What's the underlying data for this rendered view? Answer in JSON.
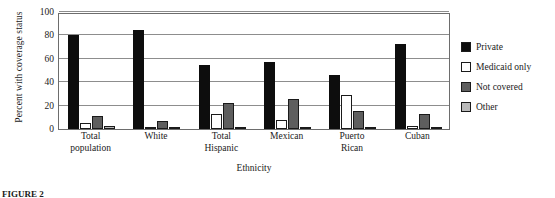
{
  "chart_data": {
    "type": "bar",
    "title": "",
    "xlabel": "Ethnicity",
    "ylabel": "Percent with coverage status",
    "ylim": [
      0,
      100
    ],
    "yticks": [
      0,
      20,
      40,
      60,
      80,
      100
    ],
    "grid": true,
    "legend_position": "right",
    "categories": [
      "Total population",
      "White",
      "Total Hispanic",
      "Mexican",
      "Puerto Rican",
      "Cuban"
    ],
    "category_lines": [
      [
        "Total",
        "population"
      ],
      [
        "White",
        ""
      ],
      [
        "Total",
        "Hispanic"
      ],
      [
        "Mexican",
        ""
      ],
      [
        "Puerto",
        "Rican"
      ],
      [
        "Cuban",
        ""
      ]
    ],
    "series": [
      {
        "name": "Private",
        "key": "private",
        "color": "#0d0d0d",
        "values": [
          80,
          85,
          55,
          57,
          46,
          73
        ]
      },
      {
        "name": "Medicaid only",
        "key": "medicaid",
        "color": "#ffffff",
        "values": [
          5,
          2,
          13,
          8,
          29,
          3
        ]
      },
      {
        "name": "Not covered",
        "key": "notcovered",
        "color": "#5e5e5e",
        "values": [
          11,
          7,
          22,
          26,
          15,
          13
        ]
      },
      {
        "name": "Other",
        "key": "other",
        "color": "#b9b9b9",
        "values": [
          3,
          1,
          1,
          1,
          1,
          2
        ]
      }
    ]
  },
  "figure": {
    "caption": "FIGURE 2"
  }
}
